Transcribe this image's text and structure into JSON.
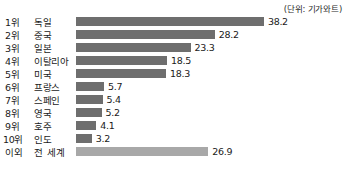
{
  "unit_note": "(단위: 기가와트)",
  "chart_data": {
    "type": "bar",
    "orientation": "horizontal",
    "title": "",
    "subtitle": "",
    "xlabel": "",
    "ylabel": "",
    "unit": "기가와트",
    "unit_note": "(단위: 기가와트)",
    "grid": false,
    "legend": "none",
    "xlim": [
      0,
      38.2
    ],
    "categories": [
      "독일",
      "중국",
      "일본",
      "이탈리아",
      "미국",
      "프랑스",
      "스페인",
      "영국",
      "호주",
      "인도",
      "전 세계"
    ],
    "ranks": [
      "1위",
      "2위",
      "3위",
      "4위",
      "5위",
      "6위",
      "7위",
      "8위",
      "9위",
      "10위",
      "이외"
    ],
    "values": [
      38.2,
      28.2,
      23.3,
      18.5,
      18.3,
      5.7,
      5.4,
      5.2,
      4.1,
      3.2,
      26.9
    ],
    "value_labels": [
      "38.2",
      "28.2",
      "23.3",
      "18.5",
      "18.3",
      "5.7",
      "5.4",
      "5.2",
      "4.1",
      "3.2",
      "26.9"
    ],
    "rows": [
      {
        "rank": "1위",
        "name": "독일",
        "value": 38.2,
        "label": "38.2",
        "highlight": false
      },
      {
        "rank": "2위",
        "name": "중국",
        "value": 28.2,
        "label": "28.2",
        "highlight": false
      },
      {
        "rank": "3위",
        "name": "일본",
        "value": 23.3,
        "label": "23.3",
        "highlight": false
      },
      {
        "rank": "4위",
        "name": "이탈리아",
        "value": 18.5,
        "label": "18.5",
        "highlight": false
      },
      {
        "rank": "5위",
        "name": "미국",
        "value": 18.3,
        "label": "18.3",
        "highlight": false
      },
      {
        "rank": "6위",
        "name": "프랑스",
        "value": 5.7,
        "label": "5.7",
        "highlight": false
      },
      {
        "rank": "7위",
        "name": "스페인",
        "value": 5.4,
        "label": "5.4",
        "highlight": false
      },
      {
        "rank": "8위",
        "name": "영국",
        "value": 5.2,
        "label": "5.2",
        "highlight": false
      },
      {
        "rank": "9위",
        "name": "호주",
        "value": 4.1,
        "label": "4.1",
        "highlight": false
      },
      {
        "rank": "10위",
        "name": "인도",
        "value": 3.2,
        "label": "3.2",
        "highlight": false
      },
      {
        "rank": "이외",
        "name": "전 세계",
        "value": 26.9,
        "label": "26.9",
        "highlight": true
      }
    ],
    "colors": {
      "bar": "#6e6e6e",
      "bar_highlight": "#a8a8a8",
      "background": "#ffffff",
      "text": "#1a1a1a"
    }
  }
}
